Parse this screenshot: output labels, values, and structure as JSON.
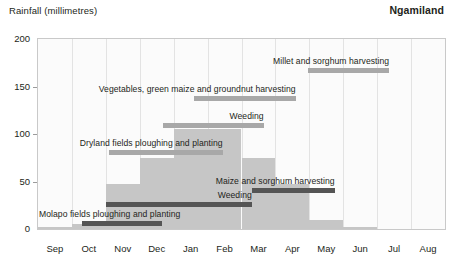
{
  "header": {
    "axis_title": "Rainfall (millimetres)",
    "region": "Ngamiland"
  },
  "chart_data": {
    "type": "bar",
    "title": "Rainfall (millimetres)",
    "subtitle": "Ngamiland",
    "xlabel": "",
    "ylabel": "Rainfall (millimetres)",
    "ylim": [
      0,
      200
    ],
    "yticks": [
      0,
      50,
      100,
      150,
      200
    ],
    "ytick_labels": [
      "0",
      "50",
      "100",
      "150",
      "200"
    ],
    "grid": "vertical",
    "legend_position": "none",
    "categories": [
      "Sep",
      "Oct",
      "Nov",
      "Dec",
      "Jan",
      "Feb",
      "Mar",
      "Apr",
      "May",
      "Jun",
      "Jul",
      "Aug"
    ],
    "values": [
      2,
      5,
      47,
      75,
      105,
      105,
      75,
      47,
      10,
      2,
      0,
      0
    ],
    "series": [
      {
        "name": "Monthly rainfall",
        "values": [
          2,
          5,
          47,
          75,
          105,
          105,
          75,
          47,
          10,
          2,
          0,
          0
        ]
      }
    ],
    "annotations": [
      {
        "label": "Millet and sorghum harvesting",
        "start_month": "May",
        "end_month": "Jul",
        "start_index": 7.95,
        "end_index": 10.35,
        "level": 170,
        "style": "light"
      },
      {
        "label": "Vegetables, green maize and groundnut harvesting",
        "start_month": "Jan",
        "end_month": "Apr",
        "start_index": 4.6,
        "end_index": 7.6,
        "level": 140,
        "style": "light"
      },
      {
        "label": "Weeding",
        "start_month": "Dec",
        "end_month": "Mar",
        "start_index": 3.7,
        "end_index": 6.65,
        "level": 112,
        "style": "light"
      },
      {
        "label": "Dryland fields ploughing and planting",
        "start_month": "Oct",
        "end_month": "Feb",
        "start_index": 2.1,
        "end_index": 5.45,
        "level": 83,
        "style": "light"
      },
      {
        "label": "Maize and sorghum harvesting",
        "start_month": "Mar",
        "end_month": "Jun",
        "start_index": 6.3,
        "end_index": 8.75,
        "level": 43,
        "style": "dark"
      },
      {
        "label": "Weeding",
        "start_month": "Nov",
        "end_month": "Mar",
        "start_index": 2.0,
        "end_index": 6.3,
        "level": 28,
        "style": "dark"
      },
      {
        "label": "Molapo fields ploughing and planting",
        "start_month": "Oct",
        "end_month": "Dec",
        "start_index": 1.3,
        "end_index": 3.65,
        "level": 8,
        "style": "dark"
      }
    ]
  },
  "colors": {
    "rainfall_bar": "#c6c6c6",
    "activity_light": "#a8a8a8",
    "activity_dark": "#555555",
    "gridline": "#e3e3e3",
    "plot_border": "#c9c9c9",
    "plot_background": "#fbfbfb",
    "text": "#231f20"
  }
}
